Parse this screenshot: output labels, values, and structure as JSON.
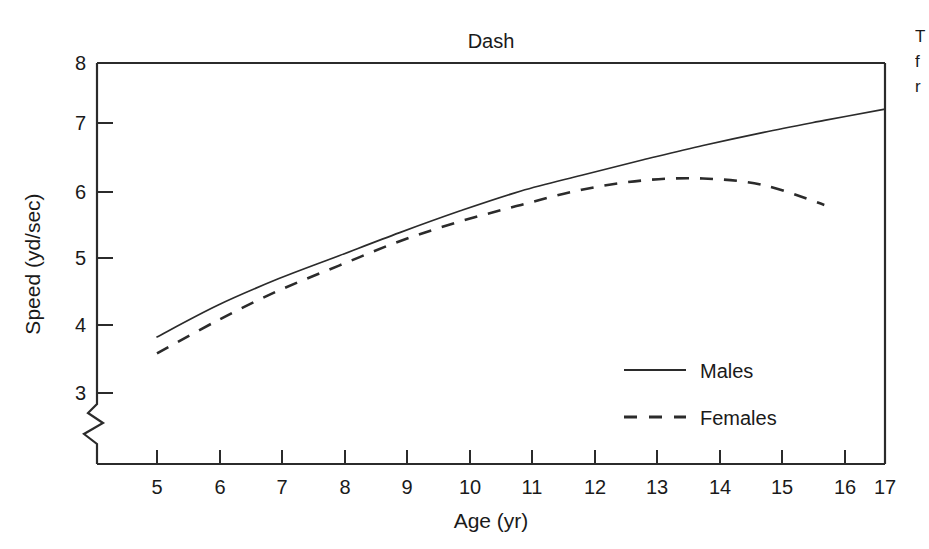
{
  "chart_data": {
    "type": "line",
    "title": "Dash",
    "xlabel": "Age (yr)",
    "ylabel": "Speed (yd/sec)",
    "xlim": [
      4.4,
      17
    ],
    "ylim": [
      3,
      8
    ],
    "xticks": [
      5,
      6,
      7,
      8,
      9,
      10,
      11,
      12,
      13,
      14,
      15,
      16,
      17
    ],
    "yticks": [
      3,
      4,
      5,
      6,
      7,
      8
    ],
    "grid": false,
    "axis_break": true,
    "axis_break_note": "zigzag break on y-axis below 3",
    "legend_position": "inside lower right",
    "x": [
      5,
      6,
      7,
      8,
      9,
      10,
      11,
      12,
      13,
      14,
      15,
      16,
      17
    ],
    "series": [
      {
        "name": "Males",
        "style": "solid",
        "color": "#2b2b2b",
        "values": [
          3.85,
          4.33,
          4.73,
          5.08,
          5.43,
          5.76,
          6.06,
          6.3,
          6.53,
          6.75,
          6.95,
          7.13,
          7.3
        ]
      },
      {
        "name": "Females",
        "style": "dashed",
        "color": "#2b2b2b",
        "values": [
          3.6,
          4.1,
          4.55,
          4.93,
          5.3,
          5.6,
          5.85,
          6.08,
          6.22,
          6.25,
          6.15,
          5.85,
          null
        ]
      }
    ]
  },
  "chart": {
    "title": "Dash",
    "x_axis_title": "Age (yr)",
    "y_axis_title": "Speed (yd/sec)",
    "x_tick_labels": [
      "5",
      "6",
      "7",
      "8",
      "9",
      "10",
      "11",
      "12",
      "13",
      "14",
      "15",
      "16",
      "17"
    ],
    "y_tick_labels": [
      "3",
      "4",
      "5",
      "6",
      "7",
      "8"
    ]
  },
  "legend": {
    "items": [
      {
        "label": "Males",
        "style": "solid"
      },
      {
        "label": "Females",
        "style": "dashed"
      }
    ]
  },
  "edge_caption": {
    "line1": "T",
    "line2": "f",
    "line3": "r"
  }
}
